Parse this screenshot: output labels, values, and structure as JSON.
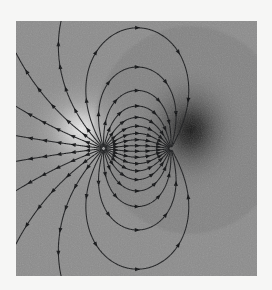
{
  "figure": {
    "kind": "vector-field-streamline-plot",
    "title": "",
    "background_color": "#f6f6f5",
    "plot_background_color": "#8c8c8c",
    "plot_rect": {
      "x": 16,
      "y": 21,
      "width": 241,
      "height": 255
    },
    "line_color": "#1a1a1a",
    "arrow_color": "#0d0d0d",
    "source_glow_color": "#e8e8e8",
    "sink_shadow_color": "#141414"
  },
  "chart_data": {
    "type": "scatter",
    "title": "",
    "subtitle": "",
    "xlabel": "",
    "ylabel": "",
    "xlim": [
      -3,
      3
    ],
    "ylim": [
      -3.2,
      3.2
    ],
    "grid": false,
    "legend": false,
    "legend_position": "none",
    "annotations": [],
    "tick_labels_x": [],
    "tick_labels_y": [],
    "charges": [
      {
        "name": "source",
        "sign": "+",
        "x": -0.82,
        "y": 0.0,
        "px": 66,
        "py": 109,
        "strength": 1
      },
      {
        "name": "sink",
        "sign": "-",
        "x": 0.86,
        "y": 0.0,
        "px": 174,
        "py": 109,
        "strength": -1
      }
    ],
    "series": [
      {
        "name": "field-lines",
        "count": 26,
        "marker": "arrowhead",
        "arrowheads_per_line": 5,
        "values": []
      }
    ]
  }
}
